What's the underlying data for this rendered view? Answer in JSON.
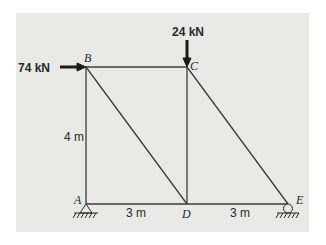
{
  "diagram": {
    "type": "truss",
    "nodes": {
      "A": {
        "label": "A",
        "support": "pin"
      },
      "B": {
        "label": "B"
      },
      "C": {
        "label": "C"
      },
      "D": {
        "label": "D"
      },
      "E": {
        "label": "E",
        "support": "roller"
      }
    },
    "members": [
      "AB",
      "BC",
      "AD",
      "DE",
      "CD",
      "BD",
      "CE"
    ],
    "loads": [
      {
        "node": "B",
        "direction": "right",
        "label": "74 kN"
      },
      {
        "node": "C",
        "direction": "down",
        "label": "24 kN"
      }
    ],
    "dimensions": {
      "height_AB": "4 m",
      "span_AD": "3 m",
      "span_DE": "3 m"
    },
    "colors": {
      "background": "#e9e9e7",
      "member": "#3c3c3c",
      "arrow": "#1a1a1a"
    }
  }
}
